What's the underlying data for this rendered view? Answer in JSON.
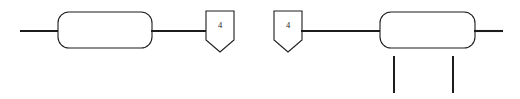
{
  "diagram": {
    "background_color": "#ffffff",
    "stroke_color": "#1c1c1c",
    "fill_color": "#ffffff",
    "canvas": {
      "width": 520,
      "height": 99
    },
    "groups": [
      {
        "id": "left-fragment",
        "name": "left-flow-fragment",
        "elements": [
          {
            "id": "left-inbound-line",
            "type": "connector-line",
            "label": ""
          },
          {
            "id": "left-process-box",
            "type": "rounded-rectangle",
            "label": ""
          },
          {
            "id": "left-outbound-line",
            "type": "connector-line",
            "label": ""
          },
          {
            "id": "left-offpage-connector",
            "type": "pentagon-connector",
            "label": "4"
          }
        ]
      },
      {
        "id": "right-fragment",
        "name": "right-flow-fragment",
        "elements": [
          {
            "id": "right-offpage-connector",
            "type": "pentagon-connector",
            "label": "4"
          },
          {
            "id": "right-inbound-line",
            "type": "connector-line",
            "label": ""
          },
          {
            "id": "right-process-box",
            "type": "rounded-rectangle",
            "label": ""
          },
          {
            "id": "right-outbound-line",
            "type": "connector-line",
            "label": ""
          },
          {
            "id": "right-drop-line-1",
            "type": "drop-line",
            "label": ""
          },
          {
            "id": "right-drop-line-2",
            "type": "drop-line",
            "label": ""
          }
        ]
      }
    ],
    "connector_labels": {
      "left_offpage": "4",
      "right_offpage": "4"
    },
    "geometry": {
      "left_inbound_line": {
        "x1": 20,
        "y1": 31,
        "x2": 59,
        "y2": 31
      },
      "left_box": {
        "x": 58,
        "y": 12,
        "width": 94,
        "height": 36,
        "rx": 11
      },
      "left_outbound_line": {
        "x1": 151,
        "y1": 31,
        "x2": 207,
        "y2": 31
      },
      "left_pentagon": {
        "x": 206,
        "y": 11,
        "width": 28,
        "height": 41,
        "notch": 12
      },
      "right_pentagon": {
        "x": 274,
        "y": 11,
        "width": 28,
        "height": 41,
        "notch": 12
      },
      "right_inbound_line": {
        "x1": 301,
        "y1": 31,
        "x2": 381,
        "y2": 31
      },
      "right_box": {
        "x": 380,
        "y": 12,
        "width": 95,
        "height": 36,
        "rx": 11
      },
      "right_outbound_line": {
        "x1": 474,
        "y1": 31,
        "x2": 503,
        "y2": 31
      },
      "drop_line_1": {
        "x1": 394,
        "y1": 56,
        "x2": 394,
        "y2": 93
      },
      "drop_line_2": {
        "x1": 453,
        "y1": 56,
        "x2": 453,
        "y2": 93
      }
    }
  }
}
